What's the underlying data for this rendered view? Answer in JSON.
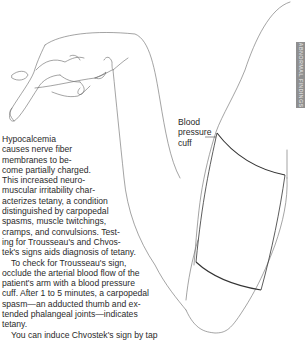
{
  "figure": {
    "callout_label_lines": [
      "Blood",
      "pressure",
      "cuff"
    ],
    "side_tab_label": "ABNORMAL FINDINGS",
    "side_tab_color": "#8f8f8f",
    "line_color": "#555555",
    "cuff_line_color": "#333333"
  },
  "text": {
    "paragraph_1_lines": [
      "Hypocalcemia",
      "causes nerve fiber",
      "membranes to be-",
      "come partially charged.",
      "This increased neuro-",
      "muscular irritability char-",
      "acterizes tetany, a condition",
      "distinguished by carpopedal",
      "spasms, muscle twitchings,",
      "cramps, and convulsions. Test-",
      "ing for Trousseau's and Chvos-",
      "tek's signs aids diagnosis of tetany."
    ],
    "paragraph_2_lines": [
      "To check for Trousseau's sign,",
      "occlude the arterial blood flow of the",
      "patient's arm with a blood pressure",
      "cuff. After 1 to 5 minutes, a carpopedal",
      "spasm—an adducted thumb and ex-",
      "tended phalangeal joints—indicates",
      "tetany."
    ],
    "paragraph_3_partial": "You can induce Chvostek's sign by tap"
  }
}
